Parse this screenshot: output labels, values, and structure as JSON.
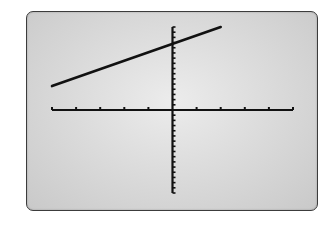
{
  "chart_data": {
    "type": "line",
    "title": "",
    "xlabel": "",
    "ylabel": "",
    "xlim": [
      -5,
      5
    ],
    "ylim": [
      -16,
      16
    ],
    "xscale": 1,
    "yscale": 1,
    "x_ticks": [
      -5,
      -4,
      -3,
      -2,
      -1,
      0,
      1,
      2,
      3,
      4,
      5
    ],
    "grid": false,
    "legend": null,
    "series": [
      {
        "name": "y = mx + b (estimated)",
        "equation_estimate": "y ≈ 1.6x + 12.7",
        "x": [
          -5,
          2
        ],
        "y": [
          4.6,
          16
        ]
      }
    ]
  },
  "display": {
    "frame_color": "#3c3c3c",
    "screen_color_center": "#ececec",
    "screen_color_edge": "#c9c9c9",
    "axis_color": "#111111",
    "line_color": "#111111"
  }
}
